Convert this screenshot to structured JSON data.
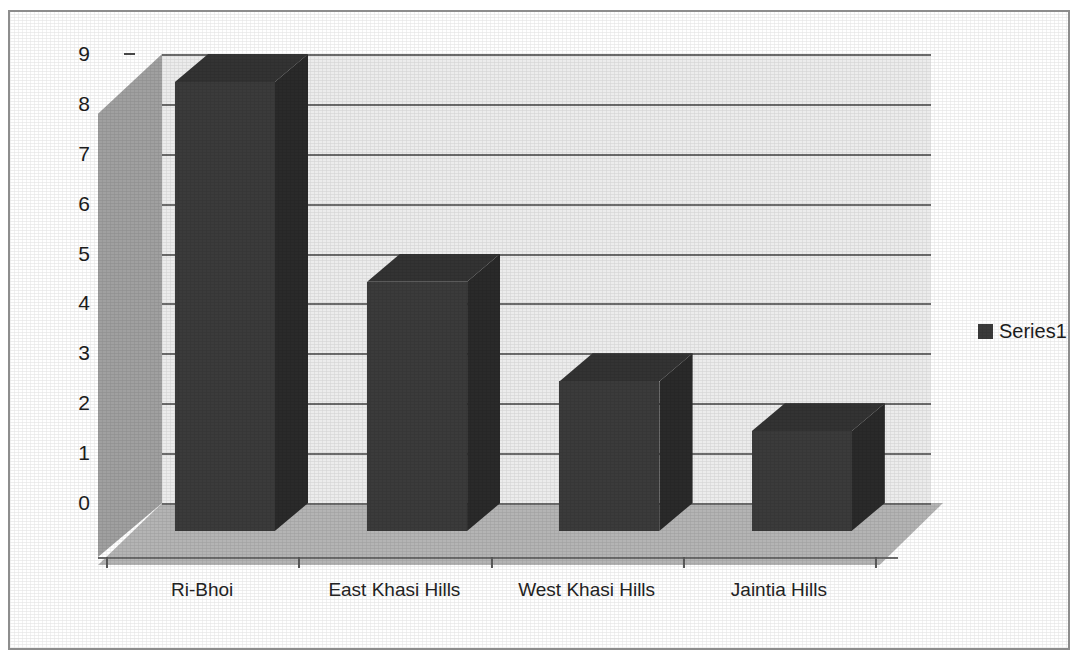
{
  "chart_data": {
    "type": "bar",
    "title": "",
    "subtitle": "",
    "xlabel": "",
    "ylabel": "",
    "categories": [
      "Ri-Bhoi",
      "East Khasi Hills",
      "West Khasi Hills",
      "Jaintia Hills"
    ],
    "series": [
      {
        "name": "Series1",
        "values": [
          9,
          5,
          3,
          2
        ]
      }
    ],
    "values": [
      9,
      5,
      3,
      2
    ],
    "ylim": [
      0,
      9
    ],
    "y_ticks": [
      "0",
      "1",
      "2",
      "3",
      "4",
      "5",
      "6",
      "7",
      "8",
      "9"
    ],
    "y_tick_values": [
      0,
      1,
      2,
      3,
      4,
      5,
      6,
      7,
      8,
      9
    ],
    "grid": true,
    "grid_axis": "y",
    "legend": {
      "position": "right",
      "entries": [
        {
          "label": "Series1",
          "color": "#3b3b3b"
        }
      ]
    },
    "style": {
      "three_d": true,
      "bar_color": "#3b3b3b",
      "bar_top_color": "#333333",
      "bar_side_color": "#2a2a2a",
      "back_wall_color": "#ececec",
      "side_wall_color": "#a0a0a0",
      "floor_color": "#b4b4b4",
      "gridline_color": "#6d6d6d",
      "frame_color": "#8d8d8d",
      "text_color": "#1d1d1d"
    }
  }
}
